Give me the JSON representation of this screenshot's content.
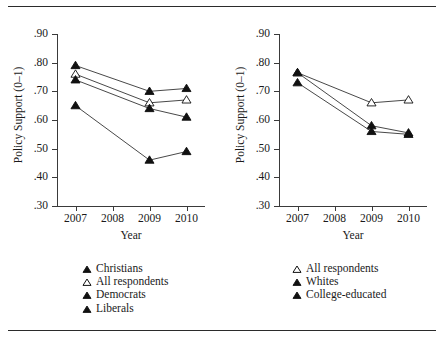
{
  "figure": {
    "clipped_caption_text": "",
    "background_color": "#ffffff",
    "rule_color": "#2b2b2b"
  },
  "chart_data": [
    {
      "type": "line",
      "panel": "left",
      "title": "",
      "xlabel": "Year",
      "ylabel": "Policy Support (0–1)",
      "x": [
        2007,
        2009,
        2010
      ],
      "xlim": [
        2006.5,
        2010.5
      ],
      "ylim": [
        0.3,
        0.9
      ],
      "xticks": [
        2007,
        2008,
        2009,
        2010
      ],
      "xtick_labels": [
        "2007",
        "2008",
        "2009",
        "2010"
      ],
      "yticks": [
        0.3,
        0.4,
        0.5,
        0.6,
        0.7,
        0.8,
        0.9
      ],
      "ytick_labels": [
        ".30",
        ".40",
        ".50",
        ".60",
        ".70",
        ".80",
        ".90"
      ],
      "grid": false,
      "legend_position": "below",
      "series": [
        {
          "name": "Christians",
          "marker": "filled-triangle",
          "values": [
            0.79,
            0.7,
            0.71
          ]
        },
        {
          "name": "All respondents",
          "marker": "open-triangle",
          "values": [
            0.76,
            0.66,
            0.67
          ]
        },
        {
          "name": "Democrats",
          "marker": "filled-triangle",
          "values": [
            0.74,
            0.64,
            0.61
          ]
        },
        {
          "name": "Liberals",
          "marker": "filled-triangle",
          "values": [
            0.65,
            0.46,
            0.49
          ]
        }
      ]
    },
    {
      "type": "line",
      "panel": "right",
      "title": "",
      "xlabel": "Year",
      "ylabel": "Policy Support (0–1)",
      "x": [
        2007,
        2009,
        2010
      ],
      "xlim": [
        2006.5,
        2010.5
      ],
      "ylim": [
        0.3,
        0.9
      ],
      "xticks": [
        2007,
        2008,
        2009,
        2010
      ],
      "xtick_labels": [
        "2007",
        "2008",
        "2009",
        "2010"
      ],
      "yticks": [
        0.3,
        0.4,
        0.5,
        0.6,
        0.7,
        0.8,
        0.9
      ],
      "ytick_labels": [
        ".30",
        ".40",
        ".50",
        ".60",
        ".70",
        ".80",
        ".90"
      ],
      "grid": false,
      "legend_position": "below",
      "series": [
        {
          "name": "All respondents",
          "marker": "open-triangle",
          "values": [
            0.765,
            0.66,
            0.67
          ]
        },
        {
          "name": "Whites",
          "marker": "filled-triangle",
          "values": [
            0.765,
            0.58,
            0.555
          ]
        },
        {
          "name": "College-educated",
          "marker": "filled-triangle",
          "values": [
            0.73,
            0.56,
            0.55
          ]
        }
      ]
    }
  ],
  "left_panel": {
    "ylabel": "Policy Support (0–1)",
    "xlabel": "Year",
    "ytick_labels": [
      ".90",
      ".80",
      ".70",
      ".60",
      ".50",
      ".40",
      ".30"
    ],
    "xtick_labels": [
      "2007",
      "2008",
      "2009",
      "2010"
    ],
    "legend": [
      {
        "label": "Christians",
        "marker": "filled-triangle"
      },
      {
        "label": "All respondents",
        "marker": "open-triangle"
      },
      {
        "label": "Democrats",
        "marker": "filled-triangle"
      },
      {
        "label": "Liberals",
        "marker": "filled-triangle"
      }
    ]
  },
  "right_panel": {
    "ylabel": "Policy Support (0–1)",
    "xlabel": "Year",
    "ytick_labels": [
      ".90",
      ".80",
      ".70",
      ".60",
      ".50",
      ".40",
      ".30"
    ],
    "xtick_labels": [
      "2007",
      "2008",
      "2009",
      "2010"
    ],
    "legend": [
      {
        "label": "All respondents",
        "marker": "open-triangle"
      },
      {
        "label": "Whites",
        "marker": "filled-triangle"
      },
      {
        "label": "College-educated",
        "marker": "filled-triangle"
      }
    ]
  }
}
